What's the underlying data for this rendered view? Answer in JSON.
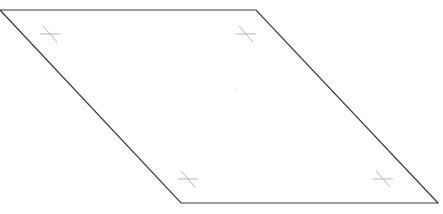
{
  "diagram": {
    "type": "parallelogram",
    "vertices": {
      "top_left": [
        0,
        10
      ],
      "top_right": [
        256,
        10
      ],
      "bottom_right": [
        438,
        203
      ],
      "bottom_left": [
        181,
        203
      ]
    },
    "corner_markers": [
      {
        "name": "top-left-marker",
        "center": [
          50,
          34
        ]
      },
      {
        "name": "top-right-marker",
        "center": [
          246,
          34
        ]
      },
      {
        "name": "bottom-left-marker",
        "center": [
          188,
          179
        ]
      },
      {
        "name": "bottom-right-marker",
        "center": [
          383,
          179
        ]
      }
    ],
    "center_point": [
      236,
      89
    ],
    "colors": {
      "edge": "#3a3a3a",
      "marker": "#b5b5b5",
      "background": "#ffffff"
    }
  }
}
